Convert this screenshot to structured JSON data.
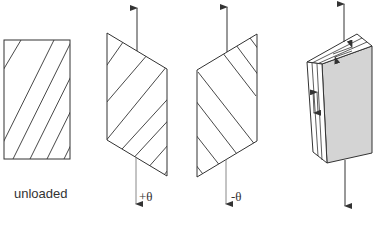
{
  "figures": [
    {
      "id": "unloaded",
      "label": "unloaded",
      "hatch_direction": "positive-slope"
    },
    {
      "id": "positive-shear",
      "label": "+θ",
      "hatch_direction": "positive-slope",
      "load": "tension"
    },
    {
      "id": "negative-shear",
      "label": "-θ",
      "hatch_direction": "negative-slope",
      "load": "tension"
    },
    {
      "id": "laminate-block",
      "label": "",
      "load": "tension",
      "face_color": "#d4d4d4"
    }
  ],
  "colors": {
    "stroke": "#333333",
    "shaded_face": "#d4d4d4",
    "background": "#ffffff"
  }
}
